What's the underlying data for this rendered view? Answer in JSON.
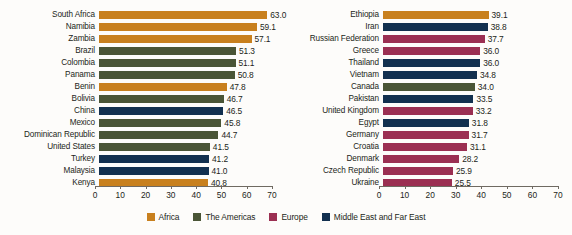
{
  "chart_data": {
    "type": "bar",
    "orientation": "horizontal",
    "title": "",
    "xlabel": "",
    "ylabel": "",
    "xlim": [
      0,
      70
    ],
    "xticks": [
      0,
      10,
      20,
      30,
      40,
      50,
      60,
      70
    ],
    "grid": false,
    "legend_position": "bottom",
    "legend": [
      {
        "name": "Africa",
        "color": "#c8801e"
      },
      {
        "name": "The Americas",
        "color": "#4a5536"
      },
      {
        "name": "Europe",
        "color": "#9b2f52"
      },
      {
        "name": "Middle East and Far East",
        "color": "#12304f"
      }
    ],
    "panels": [
      {
        "name": "left-panel",
        "categories": [
          "South Africa",
          "Namibia",
          "Zambia",
          "Brazil",
          "Colombia",
          "Panama",
          "Benin",
          "Bolivia",
          "China",
          "Mexico",
          "Dominican Republic",
          "United States",
          "Turkey",
          "Malaysia",
          "Kenya"
        ],
        "values": [
          63.0,
          59.1,
          57.1,
          51.3,
          51.1,
          50.8,
          47.8,
          46.7,
          46.5,
          45.8,
          44.7,
          41.5,
          41.2,
          41.0,
          40.8
        ],
        "value_labels": [
          "63.0",
          "59.1",
          "57.1",
          "51.3",
          "51.1",
          "50.8",
          "47.8",
          "46.7",
          "46.5",
          "45.8",
          "44.7",
          "41.5",
          "41.2",
          "41.0",
          "40.8"
        ],
        "groups": [
          "Africa",
          "Africa",
          "Africa",
          "The Americas",
          "The Americas",
          "The Americas",
          "Africa",
          "The Americas",
          "Middle East and Far East",
          "The Americas",
          "The Americas",
          "The Americas",
          "Middle East and Far East",
          "Middle East and Far East",
          "Africa"
        ]
      },
      {
        "name": "right-panel",
        "categories": [
          "Ethiopia",
          "Iran",
          "Russian Federation",
          "Greece",
          "Thailand",
          "Vietnam",
          "Canada",
          "Pakistan",
          "United Kingdom",
          "Egypt",
          "Germany",
          "Croatia",
          "Denmark",
          "Czech Republic",
          "Ukraine"
        ],
        "values": [
          39.1,
          38.8,
          37.7,
          36.0,
          36.0,
          34.8,
          34.0,
          33.5,
          33.2,
          31.8,
          31.7,
          31.1,
          28.2,
          25.9,
          25.5
        ],
        "value_labels": [
          "39.1",
          "38.8",
          "37.7",
          "36.0",
          "36.0",
          "34.8",
          "34.0",
          "33.5",
          "33.2",
          "31.8",
          "31.7",
          "31.1",
          "28.2",
          "25.9",
          "25.5"
        ],
        "groups": [
          "Africa",
          "Middle East and Far East",
          "Europe",
          "Europe",
          "Middle East and Far East",
          "Middle East and Far East",
          "The Americas",
          "Middle East and Far East",
          "Europe",
          "Middle East and Far East",
          "Europe",
          "Europe",
          "Europe",
          "Europe",
          "Europe"
        ]
      }
    ]
  }
}
